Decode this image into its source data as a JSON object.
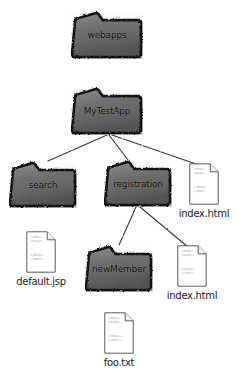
{
  "diagram": {
    "type": "directory-tree",
    "colors": {
      "folder_fill": "#6e6e6e",
      "folder_stroke": "#111111",
      "page_fill": "#ffffff",
      "page_stroke": "#5a5a5a",
      "edge": "#3a3a3a",
      "label_text": "#111111",
      "page_text": "#9a9a9a"
    },
    "page_icon_lines": [
      "<html>",
      "<body>",
      "...",
      "</body>",
      "</html>"
    ],
    "nodes": [
      {
        "id": "webapps",
        "kind": "folder",
        "label": "webapps",
        "x": 71,
        "y": 11,
        "w": 72,
        "h": 48
      },
      {
        "id": "mytestapp",
        "kind": "folder",
        "label": "MyTestApp",
        "x": 71,
        "y": 87,
        "w": 72,
        "h": 48
      },
      {
        "id": "search",
        "kind": "folder",
        "label": "search",
        "x": 9,
        "y": 161,
        "w": 68,
        "h": 47
      },
      {
        "id": "registration",
        "kind": "folder",
        "label": "registration",
        "x": 104,
        "y": 160,
        "w": 68,
        "h": 47
      },
      {
        "id": "newmember",
        "kind": "folder",
        "label": "newMember",
        "x": 85,
        "y": 245,
        "w": 68,
        "h": 47
      },
      {
        "id": "index_top",
        "kind": "file",
        "label": "index.html",
        "x": 189,
        "y": 163,
        "w": 30,
        "h": 42
      },
      {
        "id": "default_jsp",
        "kind": "file",
        "label": "default.jsp",
        "x": 26,
        "y": 231,
        "w": 30,
        "h": 42
      },
      {
        "id": "index_reg",
        "kind": "file",
        "label": "index.html",
        "x": 177,
        "y": 245,
        "w": 30,
        "h": 42
      },
      {
        "id": "foo_txt",
        "kind": "file",
        "label": "foo.txt",
        "x": 104,
        "y": 312,
        "w": 30,
        "h": 42
      }
    ],
    "edges": [
      {
        "from": "webapps",
        "to": "mytestapp",
        "x1": 107,
        "y1": 59,
        "x2": 107,
        "y2": 87
      },
      {
        "from": "mytestapp",
        "to": "search",
        "x1": 107,
        "y1": 135,
        "x2": 48,
        "y2": 161
      },
      {
        "from": "mytestapp",
        "to": "registration",
        "x1": 109,
        "y1": 135,
        "x2": 128,
        "y2": 160
      },
      {
        "from": "mytestapp",
        "to": "index_top",
        "x1": 112,
        "y1": 135,
        "x2": 196,
        "y2": 164
      },
      {
        "from": "search",
        "to": "default_jsp",
        "x1": 41,
        "y1": 208,
        "x2": 41,
        "y2": 231
      },
      {
        "from": "registration",
        "to": "newmember",
        "x1": 136,
        "y1": 207,
        "x2": 119,
        "y2": 245
      },
      {
        "from": "registration",
        "to": "index_reg",
        "x1": 140,
        "y1": 207,
        "x2": 188,
        "y2": 247
      },
      {
        "from": "newmember",
        "to": "foo_txt",
        "x1": 119,
        "y1": 292,
        "x2": 119,
        "y2": 312
      }
    ]
  }
}
